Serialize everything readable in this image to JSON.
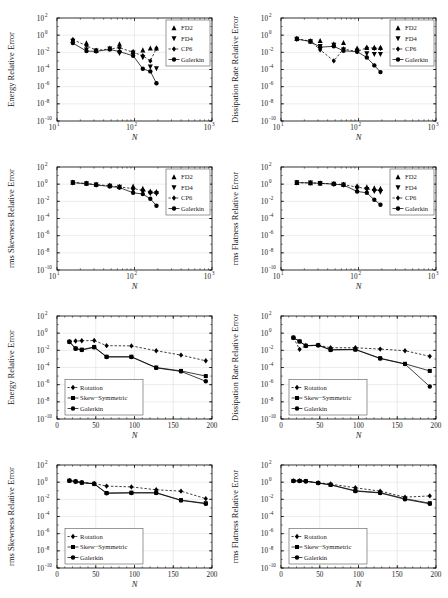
{
  "figure": {
    "rows": 4,
    "cols": 2,
    "background": "#ffffff",
    "axis_color": "#000000",
    "grid_color": "#cccccc",
    "marker_color": "#000000"
  },
  "common": {
    "xlabel": "N",
    "ylabel_prefix": "",
    "log_y_ticks": [
      "10^2",
      "10^0",
      "10^-2",
      "10^-4",
      "10^-6",
      "10^-8",
      "10^-10"
    ],
    "log_y_mant": [
      "10",
      "10",
      "10",
      "10",
      "10",
      "10",
      "10"
    ],
    "log_y_exp": [
      "2",
      "0",
      "-2",
      "-4",
      "-6",
      "-8",
      "-10"
    ],
    "log_x_mant": [
      "10",
      "10",
      "10"
    ],
    "log_x_exp": [
      "1",
      "2",
      "3"
    ],
    "lin_x_ticks": [
      "0",
      "50",
      "100",
      "150",
      "200"
    ]
  },
  "legend_scheme": {
    "scheme_a": [
      {
        "label": "FD2",
        "marker": "triangle-up",
        "line": "none"
      },
      {
        "label": "FD4",
        "marker": "triangle-down",
        "line": "none"
      },
      {
        "label": "CP6",
        "marker": "diamond",
        "line": "dashed"
      },
      {
        "label": "Galerkin",
        "marker": "circle",
        "line": "solid"
      }
    ],
    "scheme_b": [
      {
        "label": "Rotation",
        "marker": "diamond",
        "line": "dashed"
      },
      {
        "label": "Skew−Symmetric",
        "marker": "square",
        "line": "solid"
      },
      {
        "label": "Galerkin",
        "marker": "circle",
        "line": "solid"
      }
    ]
  },
  "chart_data": [
    {
      "id": "panel-energy-schemes",
      "type": "line",
      "title": "",
      "xlabel": "N",
      "ylabel": "Energy Relative Error",
      "xscale": "log",
      "yscale": "log",
      "xlim": [
        10,
        1000
      ],
      "ylim": [
        1e-10,
        100
      ],
      "grid": true,
      "legend_position": "upper-right",
      "legend": [
        "FD2",
        "FD4",
        "CP6",
        "Galerkin"
      ],
      "series": [
        {
          "name": "FD2",
          "marker": "triangle-up",
          "line": "none",
          "x": [
            16,
            24,
            32,
            48,
            64,
            96,
            128,
            160,
            192
          ],
          "y": [
            0.25,
            0.12,
            0.016,
            0.03,
            0.09,
            0.012,
            0.018,
            0.03,
            0.03
          ]
        },
        {
          "name": "FD4",
          "marker": "triangle-down",
          "line": "none",
          "x": [
            16,
            24,
            32,
            48,
            64,
            96,
            128,
            160,
            192
          ],
          "y": [
            0.2,
            0.02,
            0.015,
            0.025,
            0.008,
            0.009,
            0.0025,
            0.0002,
            0.00013
          ]
        },
        {
          "name": "CP6",
          "marker": "diamond",
          "line": "dashed",
          "x": [
            16,
            24,
            32,
            48,
            64,
            96,
            128,
            160,
            192
          ],
          "y": [
            0.3,
            0.06,
            0.017,
            0.025,
            0.035,
            0.01,
            0.004,
            0.001,
            0.03
          ]
        },
        {
          "name": "Galerkin",
          "marker": "circle",
          "line": "solid",
          "x": [
            16,
            24,
            32,
            48,
            64,
            96,
            128,
            160,
            192
          ],
          "y": [
            0.12,
            0.014,
            0.013,
            0.022,
            0.012,
            0.004,
            0.00012,
            6e-05,
            2.5e-06
          ]
        }
      ]
    },
    {
      "id": "panel-dissipation-schemes",
      "type": "line",
      "title": "",
      "xlabel": "N",
      "ylabel": "Dissipation Rate Relative Error",
      "xscale": "log",
      "yscale": "log",
      "xlim": [
        10,
        1000
      ],
      "ylim": [
        1e-10,
        100
      ],
      "grid": true,
      "legend_position": "upper-right",
      "legend": [
        "FD2",
        "FD4",
        "CP6",
        "Galerkin"
      ],
      "series": [
        {
          "name": "FD2",
          "marker": "triangle-up",
          "line": "none",
          "x": [
            16,
            24,
            32,
            48,
            64,
            96,
            128,
            160,
            192
          ],
          "y": [
            0.4,
            0.2,
            0.22,
            0.09,
            0.13,
            0.03,
            0.035,
            0.035,
            0.035
          ]
        },
        {
          "name": "FD4",
          "marker": "triangle-down",
          "line": "none",
          "x": [
            16,
            24,
            32,
            48,
            64,
            96,
            128,
            160,
            192
          ],
          "y": [
            0.35,
            0.18,
            0.05,
            0.07,
            0.02,
            0.014,
            0.007,
            0.006,
            0.006
          ]
        },
        {
          "name": "CP6",
          "marker": "diamond",
          "line": "dashed",
          "x": [
            16,
            24,
            32,
            48,
            64,
            96,
            128,
            160,
            192
          ],
          "y": [
            0.38,
            0.2,
            0.02,
            0.001,
            0.025,
            0.012,
            0.035,
            0.03,
            0.03
          ]
        },
        {
          "name": "Galerkin",
          "marker": "circle",
          "line": "solid",
          "x": [
            16,
            24,
            32,
            48,
            64,
            96,
            128,
            160,
            192
          ],
          "y": [
            0.35,
            0.18,
            0.04,
            0.05,
            0.015,
            0.012,
            0.0025,
            0.0003,
            5e-05
          ]
        }
      ]
    },
    {
      "id": "panel-skewness-schemes",
      "type": "line",
      "title": "",
      "xlabel": "N",
      "ylabel": "rms Skewness Relative Error",
      "xscale": "log",
      "yscale": "log",
      "xlim": [
        10,
        1000
      ],
      "ylim": [
        1e-10,
        100
      ],
      "grid": true,
      "legend_position": "upper-right",
      "legend": [
        "FD2",
        "FD4",
        "CP6",
        "Galerkin"
      ],
      "series": [
        {
          "name": "FD2",
          "marker": "triangle-up",
          "line": "none",
          "x": [
            16,
            24,
            32,
            48,
            64,
            96,
            128,
            160,
            192
          ],
          "y": [
            1.6,
            1.3,
            0.9,
            0.7,
            0.5,
            0.55,
            0.3,
            0.15,
            0.13
          ]
        },
        {
          "name": "FD4",
          "marker": "triangle-down",
          "line": "none",
          "x": [
            16,
            24,
            32,
            48,
            64,
            96,
            128,
            160,
            192
          ],
          "y": [
            1.5,
            1.2,
            0.85,
            0.6,
            0.45,
            0.2,
            0.12,
            0.09,
            0.08
          ]
        },
        {
          "name": "CP6",
          "marker": "diamond",
          "line": "dashed",
          "x": [
            16,
            24,
            32,
            48,
            64,
            96,
            128,
            160,
            192
          ],
          "y": [
            1.55,
            1.25,
            0.88,
            0.65,
            0.48,
            0.3,
            0.2,
            0.1,
            0.1
          ]
        },
        {
          "name": "Galerkin",
          "marker": "circle",
          "line": "solid",
          "x": [
            16,
            24,
            32,
            48,
            64,
            96,
            128,
            160,
            192
          ],
          "y": [
            1.5,
            1.1,
            0.8,
            0.55,
            0.4,
            0.1,
            0.07,
            0.02,
            0.003
          ]
        }
      ]
    },
    {
      "id": "panel-flatness-schemes",
      "type": "line",
      "title": "",
      "xlabel": "N",
      "ylabel": "rms Flatness Relative Error",
      "xscale": "log",
      "yscale": "log",
      "xlim": [
        10,
        1000
      ],
      "ylim": [
        1e-10,
        100
      ],
      "grid": true,
      "legend_position": "upper-right",
      "legend": [
        "FD2",
        "FD4",
        "CP6",
        "Galerkin"
      ],
      "series": [
        {
          "name": "FD2",
          "marker": "triangle-up",
          "line": "none",
          "x": [
            16,
            24,
            32,
            48,
            64,
            96,
            128,
            160,
            192
          ],
          "y": [
            1.5,
            1.4,
            1.3,
            1.1,
            0.9,
            0.6,
            0.45,
            0.35,
            0.3
          ]
        },
        {
          "name": "FD4",
          "marker": "triangle-down",
          "line": "none",
          "x": [
            16,
            24,
            32,
            48,
            64,
            96,
            128,
            160,
            192
          ],
          "y": [
            1.5,
            1.4,
            1.3,
            1.05,
            0.85,
            0.35,
            0.25,
            0.15,
            0.12
          ]
        },
        {
          "name": "CP6",
          "marker": "diamond",
          "line": "dashed",
          "x": [
            16,
            24,
            32,
            48,
            64,
            96,
            128,
            160,
            192
          ],
          "y": [
            1.5,
            1.4,
            1.3,
            1.08,
            0.88,
            0.45,
            0.3,
            0.2,
            0.2
          ]
        },
        {
          "name": "Galerkin",
          "marker": "circle",
          "line": "solid",
          "x": [
            16,
            24,
            32,
            48,
            64,
            96,
            128,
            160,
            192
          ],
          "y": [
            1.5,
            1.4,
            1.25,
            1.0,
            0.8,
            0.14,
            0.1,
            0.015,
            0.004
          ]
        }
      ]
    },
    {
      "id": "panel-energy-forms",
      "type": "line",
      "title": "",
      "xlabel": "N",
      "ylabel": "Energy Relative Error",
      "xscale": "linear",
      "yscale": "log",
      "xlim": [
        0,
        200
      ],
      "ylim": [
        1e-10,
        100
      ],
      "grid": true,
      "legend_position": "lower-left",
      "legend": [
        "Rotation",
        "Skew−Symmetric",
        "Galerkin"
      ],
      "series": [
        {
          "name": "Rotation",
          "marker": "diamond",
          "line": "dashed",
          "x": [
            16,
            24,
            32,
            48,
            64,
            96,
            128,
            160,
            192
          ],
          "y": [
            0.1,
            0.12,
            0.13,
            0.14,
            0.035,
            0.033,
            0.009,
            0.0028,
            0.0006
          ]
        },
        {
          "name": "Skew−Symmetric",
          "marker": "square",
          "line": "solid",
          "x": [
            16,
            24,
            32,
            48,
            64,
            96,
            128,
            160,
            192
          ],
          "y": [
            0.1,
            0.017,
            0.012,
            0.025,
            0.0018,
            0.0018,
            0.0001,
            4e-05,
            1e-05
          ]
        },
        {
          "name": "Galerkin",
          "marker": "circle",
          "line": "solid",
          "x": [
            16,
            24,
            32,
            48,
            64,
            96,
            128,
            160,
            192
          ],
          "y": [
            0.1,
            0.015,
            0.011,
            0.022,
            0.0017,
            0.0017,
            9e-05,
            3.5e-05,
            2.5e-06
          ]
        }
      ]
    },
    {
      "id": "panel-dissipation-forms",
      "type": "line",
      "title": "",
      "xlabel": "N",
      "ylabel": "Dissipation Rate Relative Error",
      "xscale": "linear",
      "yscale": "log",
      "xlim": [
        0,
        200
      ],
      "ylim": [
        1e-10,
        100
      ],
      "grid": true,
      "legend_position": "lower-left",
      "legend": [
        "Rotation",
        "Skew−Symmetric",
        "Galerkin"
      ],
      "series": [
        {
          "name": "Rotation",
          "marker": "diamond",
          "line": "dashed",
          "x": [
            16,
            24,
            32,
            48,
            64,
            96,
            128,
            160,
            192
          ],
          "y": [
            0.3,
            0.013,
            0.035,
            0.04,
            0.02,
            0.02,
            0.014,
            0.009,
            0.002
          ]
        },
        {
          "name": "Skew−Symmetric",
          "marker": "square",
          "line": "solid",
          "x": [
            16,
            24,
            32,
            48,
            64,
            96,
            128,
            160,
            192
          ],
          "y": [
            0.3,
            0.11,
            0.035,
            0.04,
            0.012,
            0.013,
            0.0012,
            0.00027,
            4e-05
          ]
        },
        {
          "name": "Galerkin",
          "marker": "circle",
          "line": "solid",
          "x": [
            16,
            24,
            32,
            48,
            64,
            96,
            128,
            160,
            192
          ],
          "y": [
            0.3,
            0.11,
            0.033,
            0.038,
            0.011,
            0.012,
            0.0011,
            0.00025,
            6e-07
          ]
        }
      ]
    },
    {
      "id": "panel-skewness-forms",
      "type": "line",
      "title": "",
      "xlabel": "N",
      "ylabel": "rms Skewness Relative Error",
      "xscale": "linear",
      "yscale": "log",
      "xlim": [
        0,
        200
      ],
      "ylim": [
        1e-10,
        100
      ],
      "grid": true,
      "legend_position": "lower-left",
      "legend": [
        "Rotation",
        "Skew−Symmetric",
        "Galerkin"
      ],
      "series": [
        {
          "name": "Rotation",
          "marker": "diamond",
          "line": "dashed",
          "x": [
            16,
            24,
            32,
            48,
            64,
            96,
            128,
            160,
            192
          ],
          "y": [
            1.5,
            1.2,
            0.9,
            0.7,
            0.35,
            0.28,
            0.13,
            0.09,
            0.012
          ]
        },
        {
          "name": "Skew−Symmetric",
          "marker": "square",
          "line": "solid",
          "x": [
            16,
            24,
            32,
            48,
            64,
            96,
            128,
            160,
            192
          ],
          "y": [
            1.5,
            1.2,
            0.9,
            0.65,
            0.055,
            0.06,
            0.06,
            0.008,
            0.0035
          ]
        },
        {
          "name": "Galerkin",
          "marker": "circle",
          "line": "solid",
          "x": [
            16,
            24,
            32,
            48,
            64,
            96,
            128,
            160,
            192
          ],
          "y": [
            1.5,
            1.2,
            0.88,
            0.62,
            0.05,
            0.055,
            0.055,
            0.0075,
            0.003
          ]
        }
      ]
    },
    {
      "id": "panel-flatness-forms",
      "type": "line",
      "title": "",
      "xlabel": "N",
      "ylabel": "rms Flatness Relative Error",
      "xscale": "linear",
      "yscale": "log",
      "xlim": [
        0,
        200
      ],
      "ylim": [
        1e-10,
        100
      ],
      "grid": true,
      "legend_position": "lower-left",
      "legend": [
        "Rotation",
        "Skew−Symmetric",
        "Galerkin"
      ],
      "series": [
        {
          "name": "Rotation",
          "marker": "diamond",
          "line": "dashed",
          "x": [
            16,
            24,
            32,
            48,
            64,
            96,
            128,
            160,
            192
          ],
          "y": [
            1.4,
            1.4,
            1.3,
            0.85,
            0.6,
            0.22,
            0.09,
            0.018,
            0.025
          ]
        },
        {
          "name": "Skew−Symmetric",
          "marker": "square",
          "line": "solid",
          "x": [
            16,
            24,
            32,
            48,
            64,
            96,
            128,
            160,
            192
          ],
          "y": [
            1.4,
            1.4,
            1.3,
            0.8,
            0.5,
            0.1,
            0.06,
            0.012,
            0.0035
          ]
        },
        {
          "name": "Galerkin",
          "marker": "circle",
          "line": "solid",
          "x": [
            16,
            24,
            32,
            48,
            64,
            96,
            128,
            160,
            192
          ],
          "y": [
            1.4,
            1.4,
            1.28,
            0.78,
            0.48,
            0.09,
            0.055,
            0.01,
            0.003
          ]
        }
      ]
    }
  ]
}
